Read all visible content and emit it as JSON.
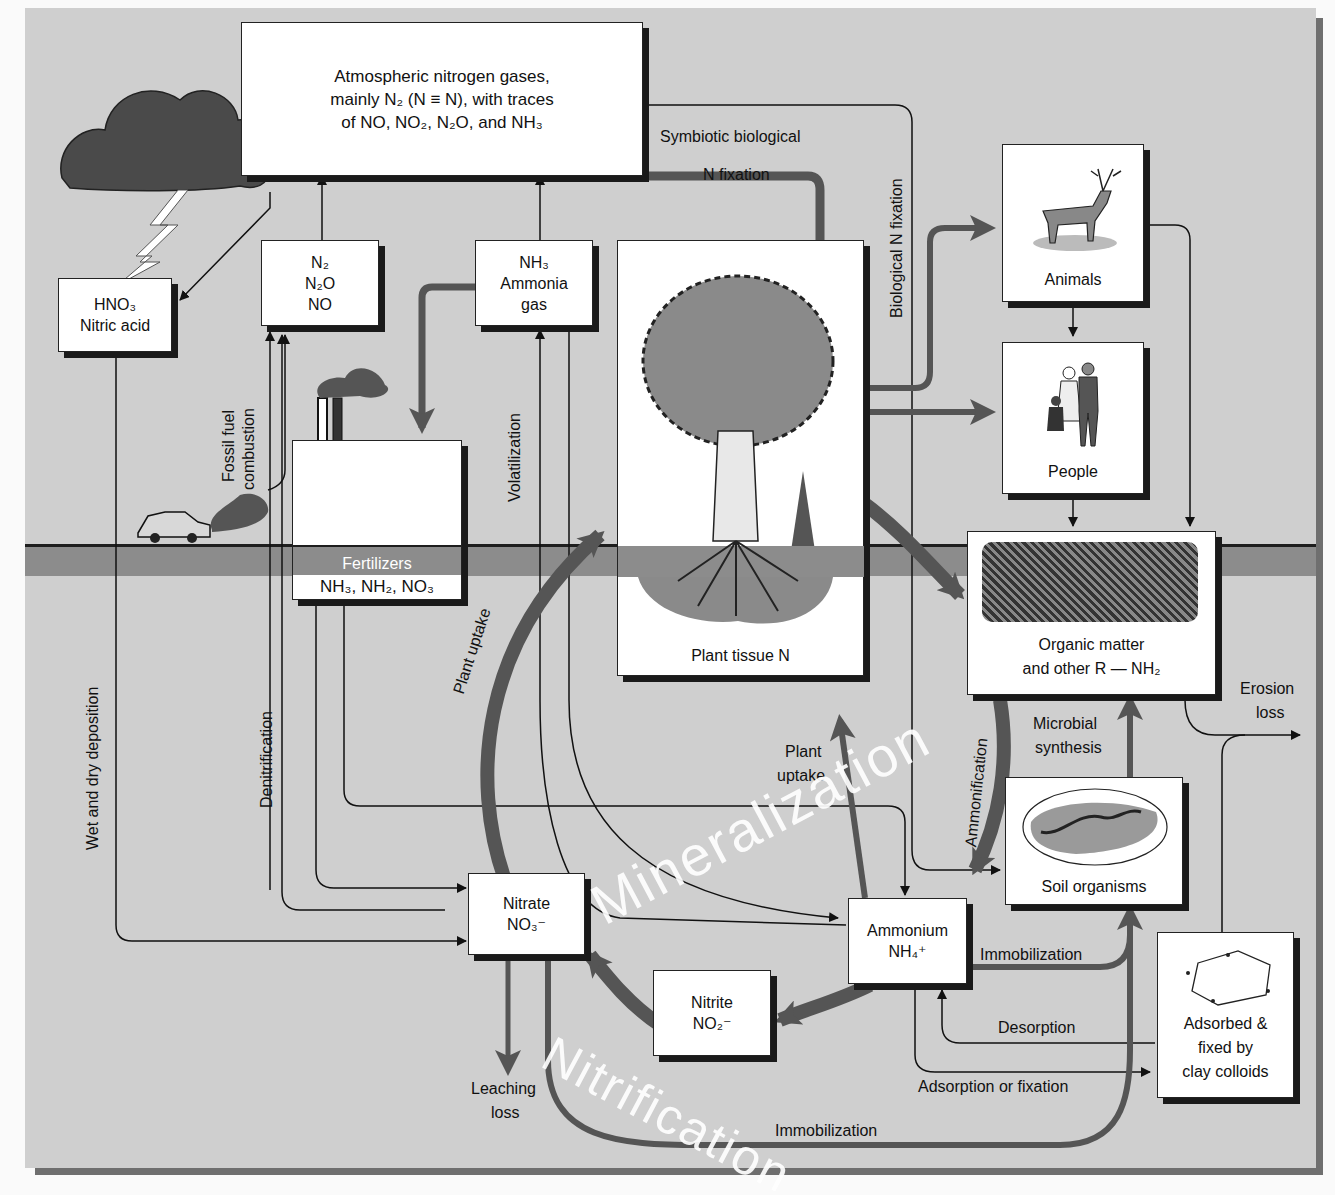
{
  "diagram": {
    "type": "nitrogen-cycle",
    "colors": {
      "background": "#cfcfcf",
      "soil_band": "#8c8c8c",
      "frame_shadow": "#6f6f6f",
      "box_fill": "#ffffff",
      "thick_arrow": "#555555",
      "thin_arrow": "#111111",
      "process_text": "#ffffff"
    }
  },
  "nodes": {
    "atmosphere": {
      "line1": "Atmospheric nitrogen gases,",
      "line2": "mainly N₂ (N ≡ N), with traces",
      "line3": "of NO, NO₂, N₂O, and NH₃"
    },
    "nitric_acid": {
      "line1": "HNO₃",
      "line2": "Nitric acid"
    },
    "n_gases": {
      "line1": "N₂",
      "line2": "N₂O",
      "line3": "NO"
    },
    "ammonia_gas": {
      "line1": "NH₃",
      "line2": "Ammonia",
      "line3": "gas"
    },
    "fertilizers": {
      "title": "Fertilizers",
      "formula": "NH₃, NH₂, NO₃"
    },
    "plant_tissue": {
      "label": "Plant tissue N"
    },
    "animals": {
      "label": "Animals"
    },
    "people": {
      "label": "People"
    },
    "organic_matter": {
      "line1": "Organic matter",
      "line2": "and other R — NH₂"
    },
    "soil_organisms": {
      "label": "Soil organisms"
    },
    "nitrate": {
      "line1": "Nitrate",
      "line2": "NO₃⁻"
    },
    "ammonium": {
      "line1": "Ammonium",
      "line2": "NH₄⁺"
    },
    "nitrite": {
      "line1": "Nitrite",
      "line2": "NO₂⁻"
    },
    "clay_colloids": {
      "line1": "Adsorbed &",
      "line2": "fixed by",
      "line3": "clay colloids"
    }
  },
  "process_labels": {
    "symbiotic_line1": "Symbiotic biological",
    "symbiotic_line2": "N fixation",
    "biological_n_fixation": "Biological N fixation",
    "fossil_fuel_line1": "Fossil fuel",
    "fossil_fuel_line2": "combustion",
    "volatilization": "Volatilization",
    "wet_dry_deposition": "Wet and dry deposition",
    "denitrification": "Denitrification",
    "plant_uptake_arc": "Plant uptake",
    "plant_uptake_line1": "Plant",
    "plant_uptake_line2": "uptake",
    "ammonification": "Ammonification",
    "microbial_line1": "Microbial",
    "microbial_line2": "synthesis",
    "erosion_line1": "Erosion",
    "erosion_line2": "loss",
    "immobilization_upper": "Immobilization",
    "immobilization_lower": "Immobilization",
    "desorption": "Desorption",
    "adsorption": "Adsorption or fixation",
    "leaching_line1": "Leaching",
    "leaching_line2": "loss",
    "mineralization": "Mineralization",
    "nitrification": "Nitrification"
  }
}
